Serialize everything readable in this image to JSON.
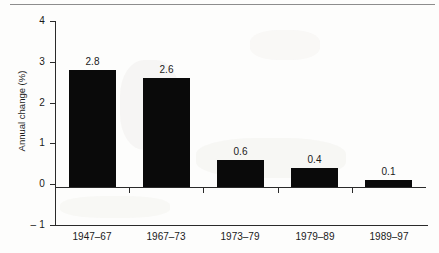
{
  "chart_data": {
    "type": "bar",
    "title": "",
    "subtitle": "",
    "xlabel": "",
    "ylabel": "Annual change (%)",
    "categories": [
      "1947–67",
      "1967–73",
      "1973–79",
      "1979–89",
      "1989–97"
    ],
    "values": [
      2.8,
      2.6,
      0.6,
      0.4,
      0.1
    ],
    "value_labels": [
      "2.8",
      "2.6",
      "0.6",
      "0.4",
      "0.1"
    ],
    "ylim": [
      -1,
      4
    ],
    "yticks": [
      4,
      3,
      2,
      1,
      0,
      -1
    ],
    "ytick_labels": [
      "4",
      "3",
      "2",
      "1",
      "0",
      "– 1"
    ],
    "grid": false,
    "legend": null,
    "bar_color": "#0a0a0a",
    "axis_color": "#2a2a2a",
    "background_color": "#fdfdfc"
  }
}
